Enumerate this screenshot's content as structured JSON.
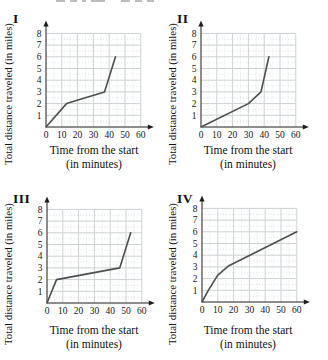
{
  "colors": {
    "background": "#ffffff",
    "axis": "#1c1c1c",
    "line": "#4d4d4d",
    "grid_major": "#ccd2d6",
    "grid_minor": "#d8dde0",
    "text": "#101010"
  },
  "chart_data": [
    {
      "id": "I",
      "type": "line",
      "title": "",
      "ylabel": "Total distance traveled (in miles)",
      "xlabel_line1": "Time from the start",
      "xlabel_line2": "(in minutes)",
      "x_ticks": [
        0,
        10,
        20,
        30,
        40,
        50,
        60
      ],
      "y_ticks": [
        1,
        2,
        3,
        4,
        5,
        6,
        7,
        8
      ],
      "xlim": [
        0,
        60
      ],
      "ylim": [
        0,
        8
      ],
      "grid": true,
      "points": [
        [
          0,
          0
        ],
        [
          13,
          2
        ],
        [
          37,
          3
        ],
        [
          44,
          6
        ]
      ]
    },
    {
      "id": "II",
      "type": "line",
      "title": "",
      "ylabel": "Total distance traveled (in miles)",
      "xlabel_line1": "Time from the start",
      "xlabel_line2": "(in minutes)",
      "x_ticks": [
        0,
        10,
        20,
        30,
        40,
        50,
        60
      ],
      "y_ticks": [
        1,
        2,
        3,
        4,
        5,
        6,
        7,
        8
      ],
      "xlim": [
        0,
        60
      ],
      "ylim": [
        0,
        8
      ],
      "grid": true,
      "points": [
        [
          0,
          0
        ],
        [
          30,
          2
        ],
        [
          38,
          3
        ],
        [
          43,
          6
        ]
      ]
    },
    {
      "id": "III",
      "type": "line",
      "title": "",
      "ylabel": "Total distance traveled (in miles)",
      "xlabel_line1": "Time from the start",
      "xlabel_line2": "(in minutes)",
      "x_ticks": [
        0,
        10,
        20,
        30,
        40,
        50,
        60
      ],
      "y_ticks": [
        1,
        2,
        3,
        4,
        5,
        6,
        7,
        8
      ],
      "xlim": [
        0,
        60
      ],
      "ylim": [
        0,
        8
      ],
      "grid": true,
      "points": [
        [
          0,
          0
        ],
        [
          6,
          2
        ],
        [
          46,
          3
        ],
        [
          53,
          6
        ]
      ]
    },
    {
      "id": "IV",
      "type": "line",
      "title": "",
      "ylabel": "Total distance traveled (in miles)",
      "xlabel_line1": "Time from the start",
      "xlabel_line2": "(in minutes)",
      "x_ticks": [
        0,
        10,
        20,
        30,
        40,
        50,
        60
      ],
      "y_ticks": [
        1,
        2,
        3,
        4,
        5,
        6,
        7,
        8
      ],
      "xlim": [
        0,
        60
      ],
      "ylim": [
        0,
        8
      ],
      "grid": true,
      "points": [
        [
          0,
          0
        ],
        [
          4,
          1
        ],
        [
          10,
          2.3
        ],
        [
          17,
          3.1
        ],
        [
          60,
          6
        ]
      ]
    }
  ]
}
